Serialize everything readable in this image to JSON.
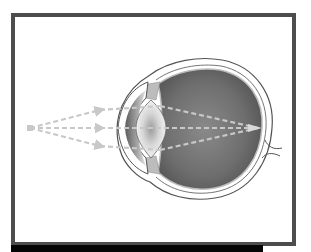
{
  "diagram": {
    "colors": {
      "frame_border": "#4d4d4d",
      "bottom_bar": "#050505",
      "background": "#ffffff",
      "eye_interior": "#6b6b6b",
      "sclera_outline": "#555555",
      "rays": "#c8c8c8",
      "lens_center": "#9a9a9a"
    },
    "elements": [
      {
        "name": "light-source-point"
      },
      {
        "name": "light-rays",
        "count": 3
      },
      {
        "name": "cornea"
      },
      {
        "name": "iris"
      },
      {
        "name": "lens"
      },
      {
        "name": "vitreous-body"
      },
      {
        "name": "retina"
      },
      {
        "name": "optic-nerve"
      }
    ]
  }
}
